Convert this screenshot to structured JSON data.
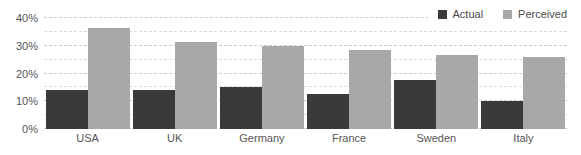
{
  "chart_data": {
    "type": "bar",
    "title": "",
    "subtitle": "",
    "xlabel": "",
    "ylabel": "",
    "categories": [
      "USA",
      "UK",
      "Germany",
      "France",
      "Sweden",
      "Italy"
    ],
    "series": [
      {
        "name": "Actual",
        "color": "#3a3a3a",
        "values": [
          14,
          14,
          15,
          12.5,
          17.5,
          10
        ]
      },
      {
        "name": "Perceived",
        "color": "#a8a8a8",
        "values": [
          36.5,
          31.5,
          30,
          28.5,
          26.5,
          26
        ]
      }
    ],
    "ylim": [
      0,
      40
    ],
    "y_ticks": [
      0,
      10,
      20,
      30,
      40
    ],
    "y_tick_labels": [
      "0%",
      "10%",
      "20%",
      "30%",
      "40%"
    ],
    "y_minor_ticks": [
      5,
      15,
      25,
      35
    ],
    "grid": true,
    "grid_axis": "y",
    "grid_style": "dashed",
    "legend": true,
    "legend_position": "top-right",
    "value_suffix": "%"
  },
  "colors": {
    "actual": "#3a3a3a",
    "perceived": "#a8a8a8",
    "gridline_major": "#cccccc",
    "gridline_minor": "#dcdcdc",
    "axis_text": "#555555",
    "legend_text": "#4a4a4a",
    "background": "#ffffff"
  }
}
